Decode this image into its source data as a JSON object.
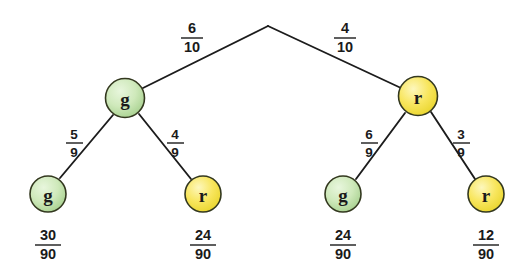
{
  "diagram": {
    "type": "probability-tree",
    "title": "",
    "colors": {
      "green_fill": "#c3e3ad",
      "green_highlight": "#e4f4d8",
      "green_stroke": "#3f4a2c",
      "yellow_fill": "#f6e14e",
      "yellow_highlight": "#fdf6b4",
      "yellow_stroke": "#4a441c",
      "line": "#1c1c1c",
      "text": "#1a1a1a",
      "background": "#ffffff"
    },
    "root": {
      "name": "root-junction",
      "x": 268,
      "y": 26
    },
    "level1": [
      {
        "name": "node-green-g",
        "label": "g",
        "color": "green",
        "x": 125,
        "y": 98,
        "branch_label": {
          "numerator": "6",
          "denominator": "10"
        },
        "branch_label_x": 192,
        "branch_label_y": 36
      },
      {
        "name": "node-yellow-r",
        "label": "r",
        "color": "yellow",
        "x": 418,
        "y": 96,
        "branch_label": {
          "numerator": "4",
          "denominator": "10"
        },
        "branch_label_x": 345,
        "branch_label_y": 36
      }
    ],
    "level2": [
      {
        "name": "leaf-g-g",
        "label": "g",
        "color": "green",
        "x": 48,
        "y": 194,
        "parent": "node-green-g",
        "branch_label": {
          "numerator": "5",
          "denominator": "9"
        },
        "branch_label_x": 74,
        "branch_label_y": 142,
        "outcome": {
          "numerator": "30",
          "denominator": "90"
        },
        "outcome_x": 48,
        "outcome_y": 243
      },
      {
        "name": "leaf-g-r",
        "label": "r",
        "color": "yellow",
        "x": 203,
        "y": 194,
        "parent": "node-green-g",
        "branch_label": {
          "numerator": "4",
          "denominator": "9"
        },
        "branch_label_x": 175,
        "branch_label_y": 142,
        "outcome": {
          "numerator": "24",
          "denominator": "90"
        },
        "outcome_x": 203,
        "outcome_y": 243
      },
      {
        "name": "leaf-r-g",
        "label": "g",
        "color": "green",
        "x": 343,
        "y": 194,
        "parent": "node-yellow-r",
        "branch_label": {
          "numerator": "6",
          "denominator": "9"
        },
        "branch_label_x": 369,
        "branch_label_y": 142,
        "outcome": {
          "numerator": "24",
          "denominator": "90"
        },
        "outcome_x": 343,
        "outcome_y": 243
      },
      {
        "name": "leaf-r-r",
        "label": "r",
        "color": "yellow",
        "x": 486,
        "y": 194,
        "parent": "node-yellow-r",
        "branch_label": {
          "numerator": "3",
          "denominator": "9"
        },
        "branch_label_x": 461,
        "branch_label_y": 142,
        "outcome": {
          "numerator": "12",
          "denominator": "90"
        },
        "outcome_x": 486,
        "outcome_y": 243
      }
    ]
  }
}
